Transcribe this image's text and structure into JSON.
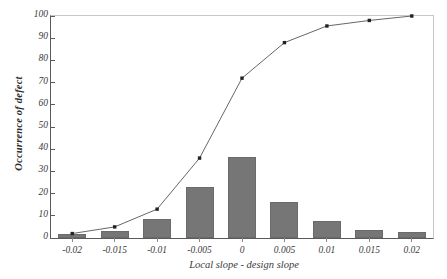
{
  "chart_data": {
    "type": "bar",
    "title": "",
    "subtitle": "",
    "xlabel": "Local slope - design slope",
    "ylabel": "Occurrence of defect",
    "categories": [
      "-0.02",
      "-0.015",
      "-0.01",
      "-0.005",
      "0",
      "0.005",
      "0.01",
      "0.015",
      "0.02"
    ],
    "x_numeric": [
      -0.02,
      -0.015,
      -0.01,
      -0.005,
      0,
      0.005,
      0.01,
      0.015,
      0.02
    ],
    "xlim": [
      -0.0225,
      0.0225
    ],
    "ylim": [
      0,
      100
    ],
    "ytick_values": [
      0,
      10,
      20,
      30,
      40,
      50,
      60,
      70,
      80,
      90,
      100
    ],
    "ytick_labels": [
      "0",
      "10",
      "20",
      "30",
      "40",
      "50",
      "60",
      "70",
      "80",
      "90",
      "100"
    ],
    "grid": false,
    "legend": null,
    "legend_position": "none",
    "series": [
      {
        "name": "Occurrence of defect",
        "type": "bar",
        "color": "#767676",
        "values": [
          2,
          3,
          8.5,
          23,
          36.5,
          16,
          7.5,
          3.5,
          2.5
        ]
      },
      {
        "name": "Cumulative occurrence",
        "type": "line",
        "color": "#555555",
        "marker": "square",
        "values": [
          2,
          5,
          13,
          36,
          72,
          88,
          95.5,
          98,
          100
        ]
      }
    ]
  },
  "styling": {
    "background": "#ffffff",
    "axis_color": "#5a5a5a",
    "frame_color": "#c9c9c9",
    "bar_fill": "#767676",
    "bar_edge": "#6a6a6a",
    "line_color": "#555555",
    "marker_color": "#222222",
    "text_color": "#3a3a3a"
  }
}
